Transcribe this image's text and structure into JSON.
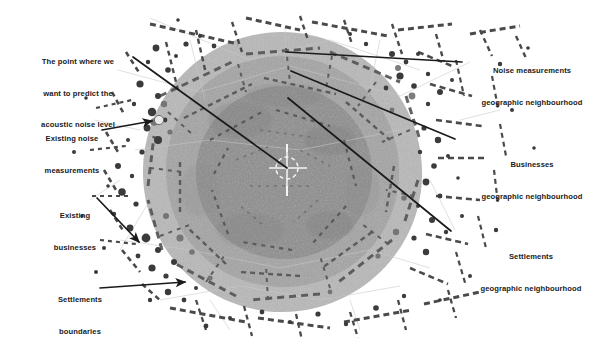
{
  "figure": {
    "type": "annotated-map-diagram",
    "background_color": "#ffffff"
  },
  "map": {
    "center_marker": {
      "name": "prediction-point-crosshair",
      "x": 287,
      "y": 168,
      "color": "#f2f2f2"
    },
    "zones": [
      {
        "key": "settlements_zone",
        "label": "Settlements geographic neighbourhood",
        "fill": "#b9b9b9",
        "radius": 140,
        "cx": 282,
        "cy": 172
      },
      {
        "key": "businesses_zone",
        "label": "Businesses geographic neighbourhood",
        "fill": "#a2a2a2",
        "radius": 116,
        "cx": 282,
        "cy": 172
      },
      {
        "key": "noise_zone",
        "label": "Noise measurements geographic neighbourhood",
        "fill": "#8c8c8c",
        "radius": 88,
        "cx": 284,
        "cy": 174
      }
    ],
    "feature_colors": {
      "roads_buildings": "#4a4a4a",
      "points": "#3d3d3d",
      "faint_lines": "#c9c9c9"
    }
  },
  "labels": {
    "predict_point": {
      "lines": [
        "The point where we",
        "want to predict the",
        "acoustic noise level"
      ],
      "x": 22,
      "y": 37
    },
    "existing_noise": {
      "lines": [
        "Existing noise",
        "measurements"
      ],
      "x": 27,
      "y": 113
    },
    "existing_businesses": {
      "lines": [
        "Existing",
        "businesses"
      ],
      "x": 39,
      "y": 190
    },
    "settlements_boundaries": {
      "lines": [
        "Settlements",
        "boundaries"
      ],
      "x": 44,
      "y": 275
    },
    "noise_neighbourhood": {
      "lines": [
        "Noise measurements",
        "geographic neighbourhood"
      ],
      "x": 467,
      "y": 52
    },
    "businesses_neighbourhood": {
      "lines": [
        "Businesses",
        "geographic neighbourhood"
      ],
      "x": 472,
      "y": 145
    },
    "settlements_neighbourhood": {
      "lines": [
        "Settlements",
        "geographic neighbourhood"
      ],
      "x": 470,
      "y": 237
    }
  },
  "leader_lines": [
    {
      "name": "leader-predict-point",
      "x1": 133,
      "y1": 57,
      "x2": 287,
      "y2": 168,
      "arrow": false
    },
    {
      "name": "leader-existing-noise",
      "x1": 102,
      "y1": 130,
      "x2": 154,
      "y2": 121,
      "arrow": true
    },
    {
      "name": "leader-existing-businesses",
      "x1": 97,
      "y1": 198,
      "x2": 140,
      "y2": 243,
      "arrow": true
    },
    {
      "name": "leader-settlements-boundaries",
      "x1": 100,
      "y1": 288,
      "x2": 187,
      "y2": 282,
      "arrow": true
    },
    {
      "name": "leader-noise-neighbourhood",
      "x1": 462,
      "y1": 62,
      "x2": 286,
      "y2": 52,
      "arrow": false
    },
    {
      "name": "leader-businesses-neighbourhood",
      "x1": 455,
      "y1": 139,
      "x2": 291,
      "y2": 71,
      "arrow": false
    },
    {
      "name": "leader-settlements-neighbourhood",
      "x1": 451,
      "y1": 231,
      "x2": 288,
      "y2": 98,
      "arrow": false
    }
  ]
}
